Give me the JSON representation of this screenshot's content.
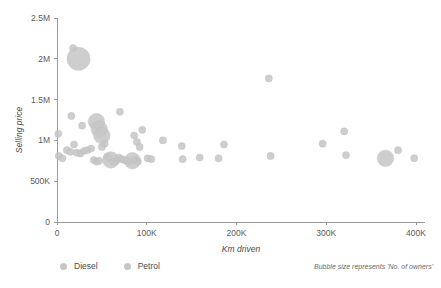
{
  "chart_data": {
    "type": "scatter",
    "title": "",
    "xlabel": "Km driven",
    "ylabel": "Selling price",
    "xlim": [
      0,
      400000
    ],
    "ylim": [
      0,
      2500000
    ],
    "grid": false,
    "legend_position": "bottom-left",
    "annotation": "Bubble size represents 'No. of owners'",
    "xticks": [
      {
        "value": 0,
        "label": "0"
      },
      {
        "value": 100000,
        "label": "100K"
      },
      {
        "value": 200000,
        "label": "200K"
      },
      {
        "value": 300000,
        "label": "300K"
      },
      {
        "value": 400000,
        "label": "400K"
      }
    ],
    "yticks": [
      {
        "value": 0,
        "label": "0"
      },
      {
        "value": 500000,
        "label": "500K"
      },
      {
        "value": 1000000,
        "label": "1M"
      },
      {
        "value": 1500000,
        "label": "1.5M"
      },
      {
        "value": 2000000,
        "label": "2M"
      },
      {
        "value": 2500000,
        "label": "2.5M"
      }
    ],
    "legend": [
      {
        "name": "Diesel",
        "color": "#c6c6c6"
      },
      {
        "name": "Petrol",
        "color": "#c6c6c6"
      }
    ],
    "size_encoding": "No. of owners",
    "series": [
      {
        "name": "Diesel",
        "color": "#c6c6c6",
        "points": [
          {
            "x": 18000,
            "y": 2130000,
            "size": 1
          },
          {
            "x": 24000,
            "y": 2000000,
            "size": 4
          },
          {
            "x": 1500,
            "y": 1080000,
            "size": 1
          },
          {
            "x": 16000,
            "y": 1300000,
            "size": 1
          },
          {
            "x": 28000,
            "y": 1180000,
            "size": 1
          },
          {
            "x": 44000,
            "y": 1230000,
            "size": 2
          },
          {
            "x": 47000,
            "y": 1140000,
            "size": 2
          },
          {
            "x": 50000,
            "y": 1060000,
            "size": 2
          },
          {
            "x": 70000,
            "y": 1350000,
            "size": 1
          },
          {
            "x": 95000,
            "y": 1130000,
            "size": 1
          },
          {
            "x": 86000,
            "y": 1060000,
            "size": 1
          },
          {
            "x": 89000,
            "y": 980000,
            "size": 1
          },
          {
            "x": 92000,
            "y": 920000,
            "size": 1
          },
          {
            "x": 118000,
            "y": 1000000,
            "size": 1
          },
          {
            "x": 139000,
            "y": 930000,
            "size": 1
          },
          {
            "x": 186000,
            "y": 950000,
            "size": 1
          },
          {
            "x": 236000,
            "y": 1760000,
            "size": 1
          },
          {
            "x": 238000,
            "y": 810000,
            "size": 1
          },
          {
            "x": 296000,
            "y": 960000,
            "size": 1
          },
          {
            "x": 320000,
            "y": 1110000,
            "size": 1
          },
          {
            "x": 322000,
            "y": 820000,
            "size": 1
          },
          {
            "x": 366000,
            "y": 780000,
            "size": 2
          },
          {
            "x": 380000,
            "y": 880000,
            "size": 1
          },
          {
            "x": 398000,
            "y": 780000,
            "size": 1
          }
        ]
      },
      {
        "name": "Petrol",
        "color": "#c6c6c6",
        "points": [
          {
            "x": 2000,
            "y": 810000,
            "size": 1
          },
          {
            "x": 6000,
            "y": 780000,
            "size": 1
          },
          {
            "x": 11000,
            "y": 880000,
            "size": 1
          },
          {
            "x": 15000,
            "y": 860000,
            "size": 1
          },
          {
            "x": 19000,
            "y": 950000,
            "size": 1
          },
          {
            "x": 22000,
            "y": 850000,
            "size": 1
          },
          {
            "x": 26000,
            "y": 840000,
            "size": 1
          },
          {
            "x": 30000,
            "y": 870000,
            "size": 1
          },
          {
            "x": 34000,
            "y": 880000,
            "size": 1
          },
          {
            "x": 38000,
            "y": 900000,
            "size": 1
          },
          {
            "x": 41000,
            "y": 760000,
            "size": 1
          },
          {
            "x": 44000,
            "y": 740000,
            "size": 1
          },
          {
            "x": 47000,
            "y": 750000,
            "size": 1
          },
          {
            "x": 50000,
            "y": 920000,
            "size": 1
          },
          {
            "x": 53000,
            "y": 960000,
            "size": 1
          },
          {
            "x": 56000,
            "y": 800000,
            "size": 1
          },
          {
            "x": 58000,
            "y": 780000,
            "size": 1
          },
          {
            "x": 60000,
            "y": 760000,
            "size": 2
          },
          {
            "x": 63000,
            "y": 740000,
            "size": 1
          },
          {
            "x": 66000,
            "y": 750000,
            "size": 1
          },
          {
            "x": 69000,
            "y": 790000,
            "size": 1
          },
          {
            "x": 72000,
            "y": 770000,
            "size": 1
          },
          {
            "x": 75000,
            "y": 760000,
            "size": 1
          },
          {
            "x": 78000,
            "y": 750000,
            "size": 1
          },
          {
            "x": 81000,
            "y": 740000,
            "size": 1
          },
          {
            "x": 84000,
            "y": 750000,
            "size": 2
          },
          {
            "x": 87000,
            "y": 760000,
            "size": 1
          },
          {
            "x": 90000,
            "y": 740000,
            "size": 1
          },
          {
            "x": 101000,
            "y": 780000,
            "size": 1
          },
          {
            "x": 105000,
            "y": 770000,
            "size": 1
          },
          {
            "x": 140000,
            "y": 770000,
            "size": 1
          },
          {
            "x": 159000,
            "y": 790000,
            "size": 1
          },
          {
            "x": 180000,
            "y": 780000,
            "size": 1
          }
        ]
      }
    ]
  }
}
